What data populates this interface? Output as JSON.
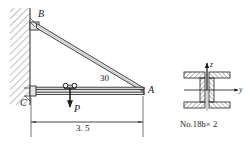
{
  "figure": {
    "type": "structural-engineering-diagram",
    "colors": {
      "line": "#1a1a1a",
      "hatch": "#555555",
      "member_fill": "#e8e8e8",
      "background": "#ffffff"
    }
  },
  "labels": {
    "joint_b": "B",
    "joint_a": "A",
    "joint_c": "C",
    "load": "P",
    "angle": "30",
    "span": "3. 5",
    "axis_z": "z",
    "axis_y": "y",
    "section_name": "No.18b× 2"
  },
  "icons": {
    "wall_hatch": "wall-hatch-icon",
    "trolley": "trolley-wheels-icon",
    "load_arrow": "downward-force-arrow-icon",
    "dimension_arrows": "dimension-arrow-icon",
    "axis_arrow_z": "axis-arrow-up-icon",
    "axis_arrow_y": "axis-arrow-right-icon",
    "section_hatch": "section-hatch-icon"
  },
  "geometry": {
    "wall_x": 30,
    "beam_y": 90,
    "joint_b": {
      "x": 36,
      "y": 22
    },
    "joint_a": {
      "x": 143,
      "y": 90
    },
    "joint_c": {
      "x": 31,
      "y": 90
    },
    "trolley": {
      "x": 70,
      "y": 87
    },
    "dimension_y": 122,
    "section_center": {
      "x": 207,
      "y": 90
    }
  }
}
